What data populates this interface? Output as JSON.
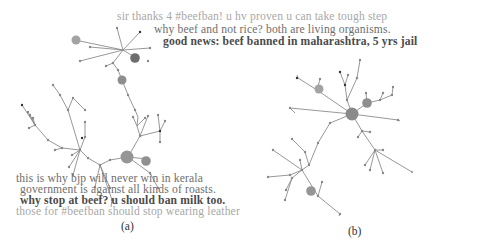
{
  "figure": {
    "panels": [
      {
        "id": "a",
        "caption": "(a)",
        "tweets": [
          {
            "text": "this is why bjp will never win in kerala",
            "color": "#6e6e6e",
            "bold": false
          },
          {
            "text": "government is against all kinds of roasts.",
            "color": "#6e6e6e",
            "bold": false
          },
          {
            "text": "why stop at beef? u should ban milk too.",
            "color": "#4a4a4a",
            "bold": true
          },
          {
            "text": "those for #beefban should stop wearing leather",
            "color": "#a8a8a8",
            "bold": false
          }
        ]
      },
      {
        "id": "b",
        "caption": "(b)",
        "tweets": [
          {
            "text": "sir thanks 4 #beefban! u hv proven u can take tough step",
            "color": "#a8a8a8",
            "bold": false
          },
          {
            "text": "why beef and not rice? both are living organisms.",
            "color": "#6e6e6e",
            "bold": false
          },
          {
            "text": "good news: beef banned in maharashtra, 5 yrs jail",
            "color": "#4a4a4a",
            "bold": true
          }
        ]
      }
    ],
    "node_colors": {
      "light": "#a0a0a0",
      "medium": "#8a8a8a",
      "dark": "#6a6a6a",
      "leaf": "#909090",
      "black": "#333333"
    }
  }
}
